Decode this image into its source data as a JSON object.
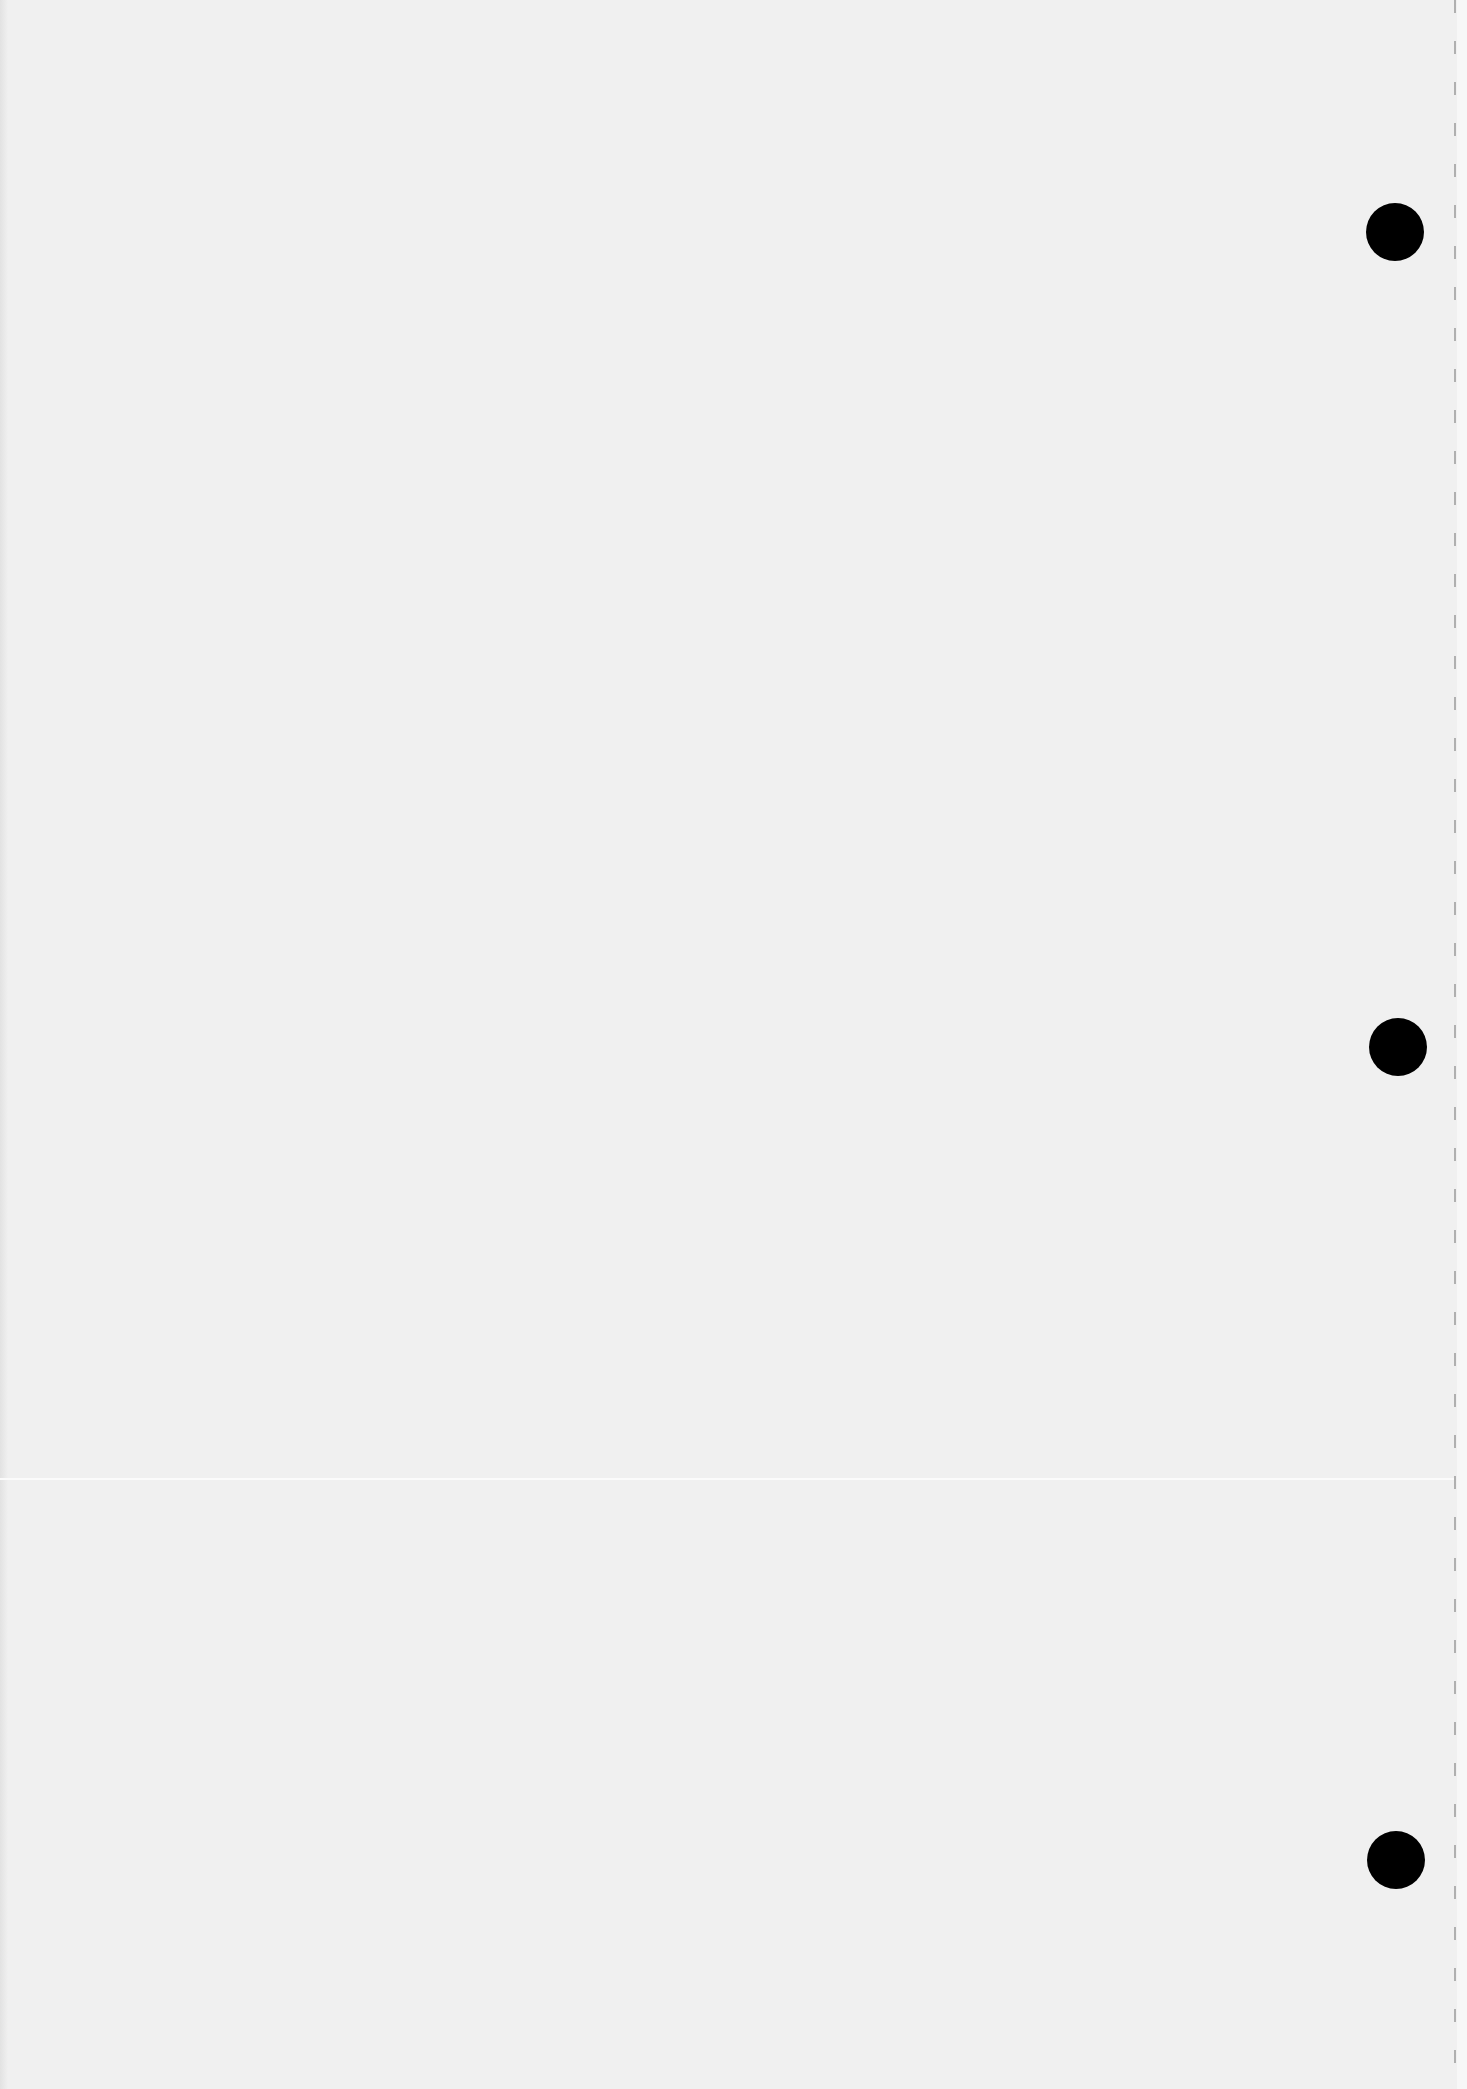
{
  "document": {
    "type": "blank scanned page",
    "background_color": "#f0f0f0",
    "text_content": ""
  },
  "punch_holes": [
    {
      "label": "top-hole",
      "cx": 1395,
      "cy": 232,
      "radius": 29,
      "color": "#000000"
    },
    {
      "label": "middle-hole",
      "cx": 1398,
      "cy": 1047,
      "radius": 29,
      "color": "#000000"
    },
    {
      "label": "bottom-hole",
      "cx": 1396,
      "cy": 1860,
      "radius": 29,
      "color": "#000000"
    }
  ],
  "perforation": {
    "x": 1455,
    "style": "dashed",
    "color": "#9a9a9a"
  },
  "scan_artifacts": {
    "horizontal_line_y": 1479
  }
}
